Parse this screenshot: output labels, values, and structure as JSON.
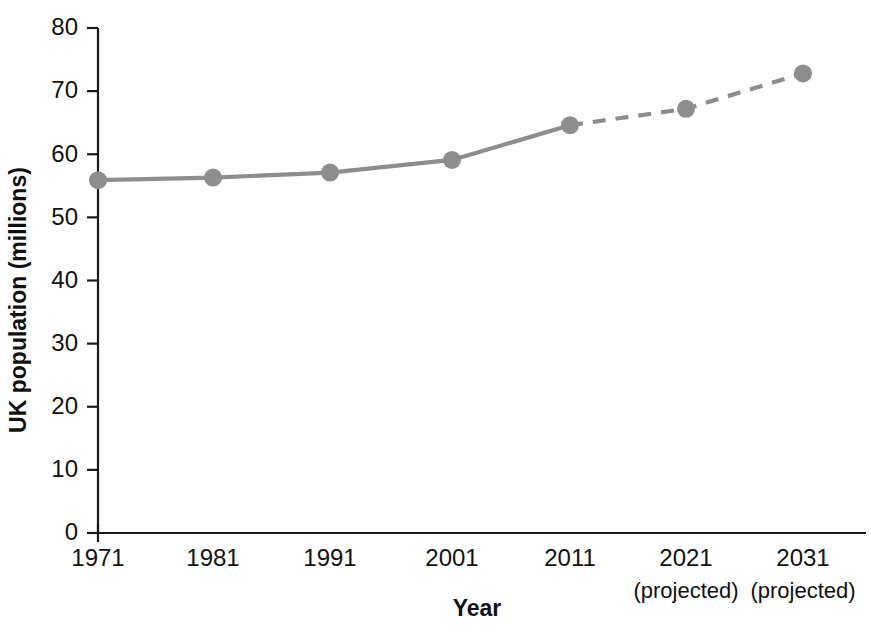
{
  "chart_data": {
    "type": "line",
    "title": "",
    "xlabel": "Year",
    "ylabel": "UK population (millions)",
    "categories": [
      "1971",
      "1981",
      "1991",
      "2001",
      "2011",
      "2021",
      "2031"
    ],
    "category_sublabels": [
      "",
      "",
      "",
      "",
      "",
      "(projected)",
      "(projected)"
    ],
    "x": [
      1971,
      1981,
      1991,
      2001,
      2011,
      2021,
      2031
    ],
    "values": [
      55.9,
      56.3,
      57.1,
      59.1,
      64.6,
      67.2,
      72.8
    ],
    "series": [
      {
        "name": "UK population",
        "values": [
          55.9,
          56.3,
          57.1,
          59.1,
          64.6,
          67.2,
          72.8
        ],
        "color": "#8d8d8d",
        "segments": [
          {
            "style": "solid",
            "from_index": 0,
            "to_index": 4
          },
          {
            "style": "dashed",
            "from_index": 4,
            "to_index": 6
          }
        ]
      }
    ],
    "ylim": [
      0,
      80
    ],
    "ytick_values": [
      0,
      10,
      20,
      30,
      40,
      50,
      60,
      70,
      80
    ],
    "ytick_labels": [
      "0",
      "10",
      "20",
      "30",
      "40",
      "50",
      "60",
      "70",
      "80"
    ],
    "grid": false,
    "legend": "none",
    "marker": "circle",
    "marker_radius": 9,
    "line_color": "#8d8d8d",
    "axis_color": "#1a1a1a",
    "background_color": "#ffffff"
  },
  "layout": {
    "plot_left": 98,
    "plot_right": 866,
    "plot_top": 28,
    "plot_bottom": 533,
    "category_x_positions": [
      98,
      213,
      330,
      452,
      570,
      686,
      803
    ],
    "xlabel_y": 566,
    "xsublabel_y": 598,
    "axis_title_x_y": 616,
    "axis_title_x_x": 477,
    "axis_title_y_x": 26,
    "axis_title_y_y": 300
  }
}
